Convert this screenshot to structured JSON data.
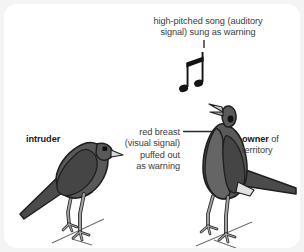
{
  "figure": {
    "type": "annotated-illustration",
    "canvas": {
      "width": 304,
      "height": 252
    },
    "background_color": "#f4f4f4",
    "card_color": "#ffffff"
  },
  "labels": {
    "song": "high-pitched song (auditory\nsignal) sung as warning",
    "breast": "red breast\n(visual signal)\npuffed out\nas warning",
    "intruder": "intruder",
    "owner_bold": "owner",
    "owner_rest": " of\nterritory"
  },
  "icons": {
    "music": "beamed-eighth-notes-icon",
    "intruder_bird": "bird-perched-icon",
    "owner_bird": "bird-singing-icon",
    "song_leader": "leader-line-vertical",
    "breast_leader": "leader-line-horizontal"
  },
  "colors": {
    "text": "#3b3b3b",
    "text_bold": "#1a1a1a",
    "bird_body": "#595959",
    "bird_wing": "#474747",
    "bird_outline": "#1f1f1f",
    "bird_leg": "#9a9a9a",
    "leader_line": "#2b2b2b",
    "note": "#1a1a1a",
    "branch": "#6f6f6f"
  }
}
